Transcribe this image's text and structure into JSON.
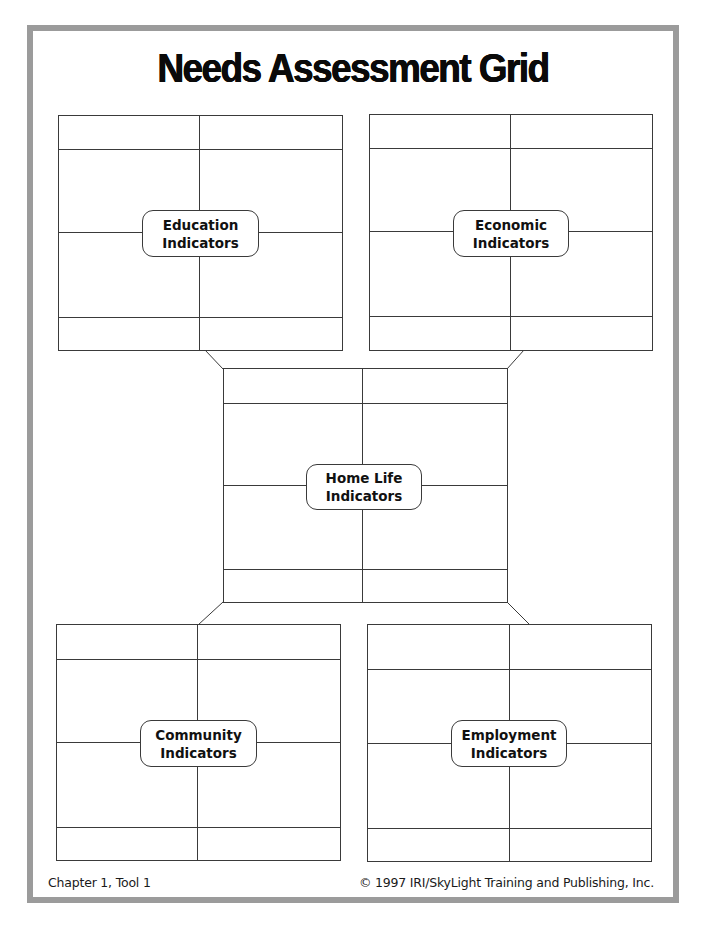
{
  "page": {
    "title": "Needs Assessment Grid",
    "colors": {
      "frame_border": "#9b9b9b",
      "line": "#3a3a3a",
      "text": "#111111",
      "background": "#ffffff"
    }
  },
  "grids": {
    "education": {
      "label_line1": "Education",
      "label_line2": "Indicators"
    },
    "economic": {
      "label_line1": "Economic",
      "label_line2": "Indicators"
    },
    "home_life": {
      "label_line1": "Home Life",
      "label_line2": "Indicators"
    },
    "community": {
      "label_line1": "Community",
      "label_line2": "Indicators"
    },
    "employment": {
      "label_line1": "Employment",
      "label_line2": "Indicators"
    }
  },
  "footer": {
    "left": "Chapter 1, Tool 1",
    "right": "© 1997 IRI/SkyLight Training and Publishing, Inc."
  }
}
